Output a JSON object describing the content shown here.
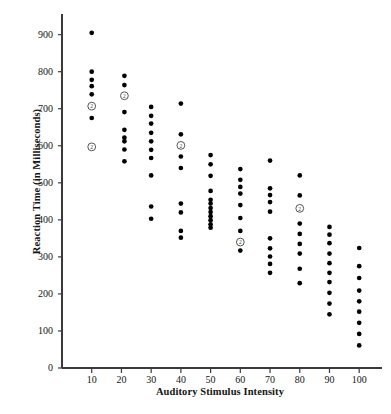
{
  "chart_data": {
    "type": "scatter",
    "title": "",
    "xlabel": "Auditory Stimulus Intensity",
    "ylabel": "Reaction Time (in Milliseconds)",
    "xlim": [
      0,
      107
    ],
    "ylim": [
      0,
      945
    ],
    "grid": false,
    "legend": null,
    "xticks": [
      10,
      20,
      30,
      40,
      50,
      60,
      70,
      80,
      90,
      100
    ],
    "xtick_labels": [
      "10",
      "20",
      "30",
      "40",
      "50",
      "60",
      "70",
      "80",
      "90",
      "100"
    ],
    "yticks": [
      0,
      100,
      200,
      300,
      400,
      500,
      600,
      700,
      800,
      900
    ],
    "ytick_labels": [
      "0",
      "100",
      "200",
      "300",
      "400",
      "500",
      "600",
      "700",
      "800",
      "900"
    ],
    "marker": "filled-circle",
    "marker_color": "#000000",
    "overlap_marker": "circled-2",
    "overlap_note": "A circled numeral 2 marks a location where two observations coincide.",
    "points": [
      {
        "x": 10,
        "y": 905,
        "n": 1
      },
      {
        "x": 10,
        "y": 800,
        "n": 1
      },
      {
        "x": 10,
        "y": 778,
        "n": 1
      },
      {
        "x": 10,
        "y": 761,
        "n": 1
      },
      {
        "x": 10,
        "y": 739,
        "n": 1
      },
      {
        "x": 10,
        "y": 707,
        "n": 2
      },
      {
        "x": 10,
        "y": 675,
        "n": 1
      },
      {
        "x": 10,
        "y": 597,
        "n": 2
      },
      {
        "x": 21,
        "y": 789,
        "n": 1
      },
      {
        "x": 21,
        "y": 764,
        "n": 1
      },
      {
        "x": 21,
        "y": 735,
        "n": 2
      },
      {
        "x": 21,
        "y": 691,
        "n": 1
      },
      {
        "x": 21,
        "y": 643,
        "n": 1
      },
      {
        "x": 21,
        "y": 622,
        "n": 1
      },
      {
        "x": 21,
        "y": 612,
        "n": 1
      },
      {
        "x": 21,
        "y": 590,
        "n": 1
      },
      {
        "x": 21,
        "y": 558,
        "n": 1
      },
      {
        "x": 30,
        "y": 705,
        "n": 1
      },
      {
        "x": 30,
        "y": 681,
        "n": 1
      },
      {
        "x": 30,
        "y": 660,
        "n": 1
      },
      {
        "x": 30,
        "y": 635,
        "n": 1
      },
      {
        "x": 30,
        "y": 612,
        "n": 1
      },
      {
        "x": 30,
        "y": 589,
        "n": 1
      },
      {
        "x": 30,
        "y": 567,
        "n": 1
      },
      {
        "x": 30,
        "y": 520,
        "n": 1
      },
      {
        "x": 30,
        "y": 436,
        "n": 1
      },
      {
        "x": 30,
        "y": 403,
        "n": 1
      },
      {
        "x": 40,
        "y": 714,
        "n": 1
      },
      {
        "x": 40,
        "y": 631,
        "n": 1
      },
      {
        "x": 40,
        "y": 601,
        "n": 2
      },
      {
        "x": 40,
        "y": 571,
        "n": 1
      },
      {
        "x": 40,
        "y": 540,
        "n": 1
      },
      {
        "x": 40,
        "y": 444,
        "n": 1
      },
      {
        "x": 40,
        "y": 420,
        "n": 1
      },
      {
        "x": 40,
        "y": 370,
        "n": 1
      },
      {
        "x": 40,
        "y": 352,
        "n": 1
      },
      {
        "x": 50,
        "y": 575,
        "n": 1
      },
      {
        "x": 50,
        "y": 550,
        "n": 1
      },
      {
        "x": 50,
        "y": 519,
        "n": 1
      },
      {
        "x": 50,
        "y": 478,
        "n": 1
      },
      {
        "x": 50,
        "y": 454,
        "n": 1
      },
      {
        "x": 50,
        "y": 444,
        "n": 1
      },
      {
        "x": 50,
        "y": 432,
        "n": 1
      },
      {
        "x": 50,
        "y": 421,
        "n": 1
      },
      {
        "x": 50,
        "y": 410,
        "n": 1
      },
      {
        "x": 50,
        "y": 399,
        "n": 1
      },
      {
        "x": 50,
        "y": 388,
        "n": 1
      },
      {
        "x": 50,
        "y": 379,
        "n": 1
      },
      {
        "x": 60,
        "y": 537,
        "n": 1
      },
      {
        "x": 60,
        "y": 508,
        "n": 1
      },
      {
        "x": 60,
        "y": 489,
        "n": 1
      },
      {
        "x": 60,
        "y": 471,
        "n": 1
      },
      {
        "x": 60,
        "y": 440,
        "n": 1
      },
      {
        "x": 60,
        "y": 405,
        "n": 1
      },
      {
        "x": 60,
        "y": 370,
        "n": 1
      },
      {
        "x": 60,
        "y": 340,
        "n": 2
      },
      {
        "x": 60,
        "y": 317,
        "n": 1
      },
      {
        "x": 70,
        "y": 560,
        "n": 1
      },
      {
        "x": 70,
        "y": 485,
        "n": 1
      },
      {
        "x": 70,
        "y": 467,
        "n": 1
      },
      {
        "x": 70,
        "y": 448,
        "n": 1
      },
      {
        "x": 70,
        "y": 422,
        "n": 1
      },
      {
        "x": 70,
        "y": 350,
        "n": 1
      },
      {
        "x": 70,
        "y": 323,
        "n": 1
      },
      {
        "x": 70,
        "y": 301,
        "n": 1
      },
      {
        "x": 70,
        "y": 281,
        "n": 1
      },
      {
        "x": 70,
        "y": 257,
        "n": 1
      },
      {
        "x": 80,
        "y": 520,
        "n": 1
      },
      {
        "x": 80,
        "y": 466,
        "n": 1
      },
      {
        "x": 80,
        "y": 431,
        "n": 2
      },
      {
        "x": 80,
        "y": 390,
        "n": 1
      },
      {
        "x": 80,
        "y": 362,
        "n": 1
      },
      {
        "x": 80,
        "y": 335,
        "n": 1
      },
      {
        "x": 80,
        "y": 309,
        "n": 1
      },
      {
        "x": 80,
        "y": 268,
        "n": 1
      },
      {
        "x": 80,
        "y": 229,
        "n": 1
      },
      {
        "x": 90,
        "y": 381,
        "n": 1
      },
      {
        "x": 90,
        "y": 360,
        "n": 1
      },
      {
        "x": 90,
        "y": 337,
        "n": 1
      },
      {
        "x": 90,
        "y": 309,
        "n": 1
      },
      {
        "x": 90,
        "y": 283,
        "n": 1
      },
      {
        "x": 90,
        "y": 257,
        "n": 1
      },
      {
        "x": 90,
        "y": 232,
        "n": 1
      },
      {
        "x": 90,
        "y": 203,
        "n": 1
      },
      {
        "x": 90,
        "y": 174,
        "n": 1
      },
      {
        "x": 90,
        "y": 145,
        "n": 1
      },
      {
        "x": 100,
        "y": 324,
        "n": 1
      },
      {
        "x": 100,
        "y": 275,
        "n": 1
      },
      {
        "x": 100,
        "y": 243,
        "n": 1
      },
      {
        "x": 100,
        "y": 209,
        "n": 1
      },
      {
        "x": 100,
        "y": 180,
        "n": 1
      },
      {
        "x": 100,
        "y": 152,
        "n": 1
      },
      {
        "x": 100,
        "y": 122,
        "n": 1
      },
      {
        "x": 100,
        "y": 92,
        "n": 1
      },
      {
        "x": 100,
        "y": 61,
        "n": 1
      }
    ]
  }
}
